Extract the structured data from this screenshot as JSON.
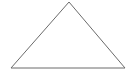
{
  "canvas": {
    "width": 133,
    "height": 78,
    "background_color": "#ffffff"
  },
  "figure": {
    "name": "triangle",
    "stroke_color": "#6b6b6b",
    "fill_color": "none",
    "stroke_width": 1,
    "vertices": [
      {
        "label": "apex",
        "x": 69,
        "y": 2
      },
      {
        "label": "bottom-right",
        "x": 125,
        "y": 68
      },
      {
        "label": "bottom-left",
        "x": 11,
        "y": 68
      }
    ],
    "points_attr": "69,2 125,68 11,68",
    "edges": [
      {
        "name": "left-edge",
        "from": "bottom-left",
        "to": "apex"
      },
      {
        "name": "right-edge",
        "from": "apex",
        "to": "bottom-right"
      },
      {
        "name": "base-edge",
        "from": "bottom-right",
        "to": "bottom-left"
      }
    ]
  },
  "labels": {
    "title": "",
    "caption": ""
  }
}
